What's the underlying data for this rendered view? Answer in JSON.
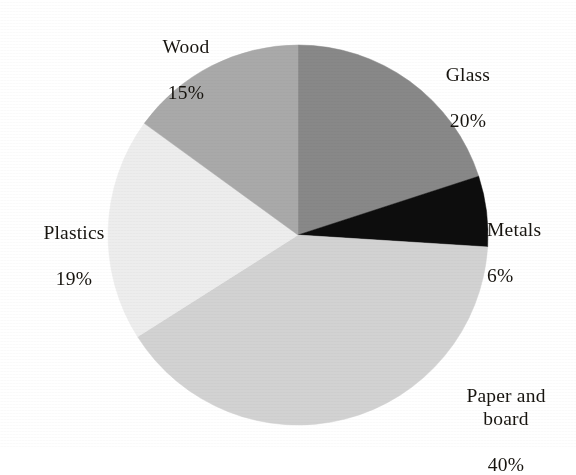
{
  "chart_data": {
    "type": "pie",
    "title": "",
    "subtitle": "",
    "xlabel": "",
    "ylabel": "",
    "legend_position": "none",
    "grid": false,
    "unit": "%",
    "start_angle_deg": 0,
    "direction": "clockwise",
    "categories": [
      "Glass",
      "Metals",
      "Paper and board",
      "Plastics",
      "Wood"
    ],
    "values": [
      20,
      6,
      40,
      19,
      15
    ],
    "total": 100,
    "slices": [
      {
        "label": "Glass",
        "value": 20,
        "value_text": "20%",
        "color": "#888888",
        "start_deg": 0,
        "end_deg": 72
      },
      {
        "label": "Metals",
        "value": 6,
        "value_text": "6%",
        "color": "#0d0d0d",
        "start_deg": 72,
        "end_deg": 93.6
      },
      {
        "label": "Paper and board",
        "value": 40,
        "value_text": "40%",
        "color": "#d2d2d2",
        "start_deg": 93.6,
        "end_deg": 237.6
      },
      {
        "label": "Plastics",
        "value": 19,
        "value_text": "19%",
        "color": "#ededed",
        "start_deg": 237.6,
        "end_deg": 306
      },
      {
        "label": "Wood",
        "value": 15,
        "value_text": "15%",
        "color": "#a9a9a9",
        "start_deg": 306,
        "end_deg": 360
      }
    ],
    "geometry": {
      "center_x": 298,
      "center_y": 235,
      "radius": 190
    }
  },
  "labels": {
    "glass": {
      "name": "Glass",
      "percent": "20%"
    },
    "metals": {
      "name": "Metals",
      "percent": "6%"
    },
    "paper": {
      "name": "Paper and\nboard",
      "percent": "40%"
    },
    "plastics": {
      "name": "Plastics",
      "percent": "19%"
    },
    "wood": {
      "name": "Wood",
      "percent": "15%"
    }
  },
  "colors": {
    "background": "#ffffff",
    "text": "#17140f",
    "glass": "#888888",
    "metals": "#0d0d0d",
    "paper": "#d2d2d2",
    "plastics": "#ededed",
    "wood": "#a9a9a9"
  }
}
